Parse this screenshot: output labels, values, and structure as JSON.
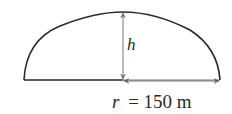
{
  "diagram": {
    "shape": "circular segment (dome cross-section)",
    "height_label": "h",
    "radius_label": "r = 150 m",
    "radius_var": "r",
    "radius_value": "= 150 m",
    "colors": {
      "outline": "#2a2a2a",
      "arrows": "#777777",
      "background": "#ffffff"
    }
  }
}
